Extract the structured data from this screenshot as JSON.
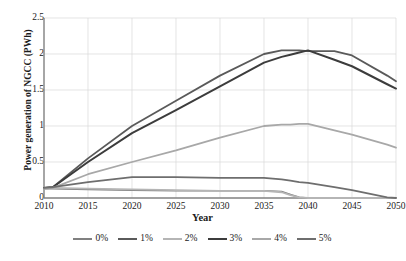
{
  "chart_data": {
    "type": "line",
    "title": "",
    "xlabel": "Year",
    "ylabel": "Power generation of NGCC (PWh)",
    "xlim": [
      2010,
      2050
    ],
    "ylim": [
      0,
      2.5
    ],
    "xticks": [
      2010,
      2015,
      2020,
      2025,
      2030,
      2035,
      2040,
      2045,
      2050
    ],
    "xtick_labels": [
      "2010",
      "2015",
      "2020",
      "2025",
      "2030",
      "2035",
      "2040",
      "2045",
      "2050"
    ],
    "yticks": [
      0,
      0.5,
      1,
      1.5,
      2,
      2.5
    ],
    "ytick_labels": [
      "0",
      "0.5",
      "1",
      "1.5",
      "2",
      "2.5"
    ],
    "grid": "horizontal-and-vertical",
    "grid_color": "#d9d9d9",
    "legend_position": "bottom",
    "x": [
      2010,
      2011,
      2015,
      2020,
      2025,
      2030,
      2035,
      2037,
      2038,
      2039,
      2040,
      2043,
      2045,
      2049,
      2050
    ],
    "series": [
      {
        "name": "0%",
        "color": "#808080",
        "width": 1.6,
        "values": [
          0.13,
          0.13,
          0.12,
          0.11,
          0.1,
          0.1,
          0.1,
          0.09,
          0.05,
          0.01,
          0.0,
          0.0,
          0.0,
          0.0,
          0.0
        ]
      },
      {
        "name": "1%",
        "color": "#5a5a5a",
        "width": 1.8,
        "values": [
          0.14,
          0.15,
          0.55,
          1.0,
          1.35,
          1.7,
          2.0,
          2.05,
          2.05,
          2.05,
          2.04,
          2.04,
          1.98,
          1.7,
          1.62
        ]
      },
      {
        "name": "2%",
        "color": "#b5b5b5",
        "width": 1.8,
        "values": [
          0.13,
          0.14,
          0.13,
          0.12,
          0.11,
          0.1,
          0.1,
          0.08,
          0.04,
          0.01,
          0.0,
          0.0,
          0.0,
          0.0,
          0.0
        ]
      },
      {
        "name": "3%",
        "color": "#3c3c3c",
        "width": 2.0,
        "values": [
          0.14,
          0.15,
          0.5,
          0.9,
          1.22,
          1.55,
          1.88,
          1.96,
          1.99,
          2.02,
          2.05,
          1.92,
          1.83,
          1.58,
          1.52
        ]
      },
      {
        "name": "4%",
        "color": "#a8a8a8",
        "width": 1.8,
        "values": [
          0.13,
          0.14,
          0.33,
          0.5,
          0.66,
          0.84,
          1.0,
          1.02,
          1.02,
          1.03,
          1.03,
          0.94,
          0.88,
          0.74,
          0.7
        ]
      },
      {
        "name": "5%",
        "color": "#6e6e6e",
        "width": 1.8,
        "values": [
          0.14,
          0.15,
          0.22,
          0.29,
          0.29,
          0.28,
          0.28,
          0.26,
          0.24,
          0.22,
          0.21,
          0.15,
          0.11,
          0.01,
          0.0
        ]
      }
    ]
  },
  "legend": {
    "items": [
      {
        "label": "0%",
        "color": "#808080"
      },
      {
        "label": "1%",
        "color": "#5a5a5a"
      },
      {
        "label": "2%",
        "color": "#b5b5b5"
      },
      {
        "label": "3%",
        "color": "#3c3c3c"
      },
      {
        "label": "4%",
        "color": "#a8a8a8"
      },
      {
        "label": "5%",
        "color": "#6e6e6e"
      }
    ]
  },
  "axes": {
    "axis_line_color": "#808080",
    "text_color": "#1b1b1b"
  }
}
